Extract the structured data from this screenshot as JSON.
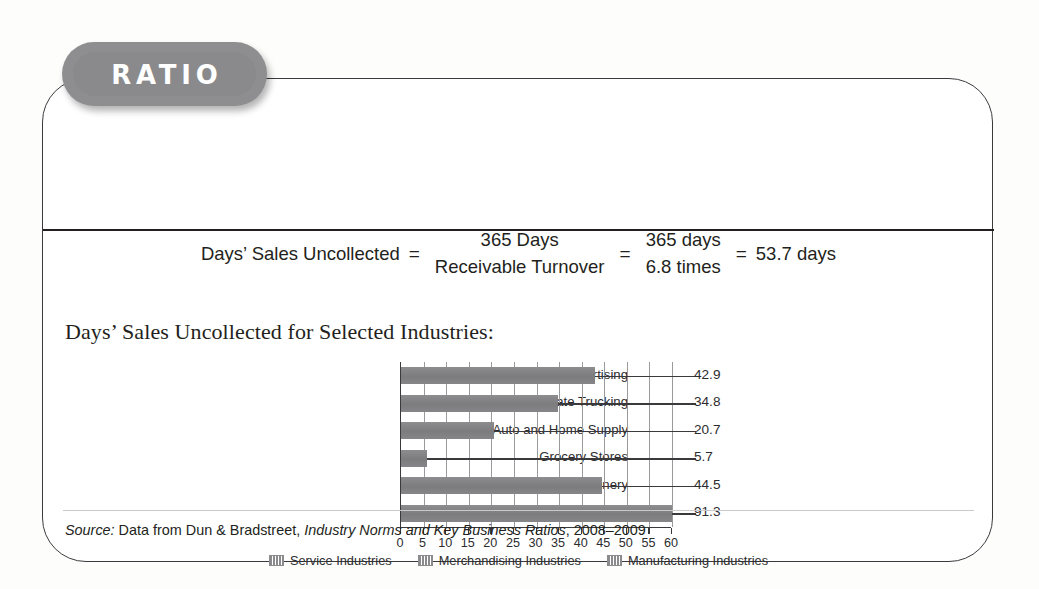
{
  "badge": {
    "label": "RATIO",
    "color": "#8e8e90"
  },
  "formula": {
    "lhs": "Days’ Sales Uncollected",
    "eq1": "=",
    "frac1_num": "365 Days",
    "frac1_den": "Receivable Turnover",
    "eq2": "=",
    "frac2_num": "365 days",
    "frac2_den": "6.8 times",
    "eq3": "=",
    "result": "53.7 days"
  },
  "subtitle": "Days’ Sales Uncollected for Selected Industries:",
  "chart_data": {
    "type": "bar",
    "orientation": "horizontal",
    "title": "Days’ Sales Uncollected for Selected Industries:",
    "xlabel": "",
    "ylabel": "",
    "xlim": [
      0,
      60
    ],
    "xticks": [
      0,
      5,
      10,
      15,
      20,
      25,
      30,
      35,
      40,
      45,
      50,
      55,
      60
    ],
    "grid": true,
    "grid_axis": "x",
    "categories": [
      "Advertising",
      "Interstate Trucking",
      "Auto and Home Supply",
      "Grocery Stores",
      "Machinery",
      "Computers"
    ],
    "values": [
      42.9,
      34.8,
      20.7,
      5.7,
      44.5,
      91.3
    ],
    "value_labels": [
      "42.9",
      "34.8",
      "20.7",
      "5.7",
      "44.5",
      "91.3"
    ],
    "series_groups": [
      "Service Industries",
      "Service Industries",
      "Merchandising Industries",
      "Merchandising Industries",
      "Manufacturing Industries",
      "Manufacturing Industries"
    ],
    "bar_color": "#828285",
    "legend_position": "bottom",
    "legend": [
      "Service Industries",
      "Merchandising Industries",
      "Manufacturing Industries"
    ],
    "note": "Computers bar (91.3) extends past the 60 axis maximum and is clipped at the plot edge."
  },
  "source": {
    "prefix": "Source:",
    "text1": " Data from Dun & Bradstreet, ",
    "italic_title": "Industry Norms and Key Business Ratios",
    "text2": ", 2008–2009"
  }
}
